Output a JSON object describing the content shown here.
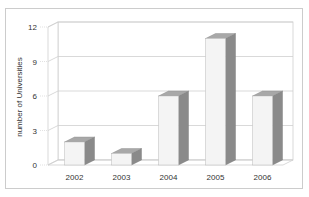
{
  "chart_data": {
    "type": "bar",
    "style": "3d-column",
    "title": "",
    "xlabel": "",
    "ylabel": "number of Universities",
    "categories": [
      "2002",
      "2003",
      "2004",
      "2005",
      "2006"
    ],
    "values": [
      2,
      1,
      6,
      11,
      6
    ],
    "ylim": [
      0,
      12
    ],
    "yticks": [
      "0",
      "3",
      "6",
      "9",
      "12"
    ],
    "grid": true,
    "legend": "none",
    "colors": {
      "bar_front": "#f4f4f4",
      "bar_top": "#a8a8a8",
      "bar_side": "#8a8a8a",
      "grid": "#cfcfcf",
      "frame": "#cccccc"
    }
  }
}
